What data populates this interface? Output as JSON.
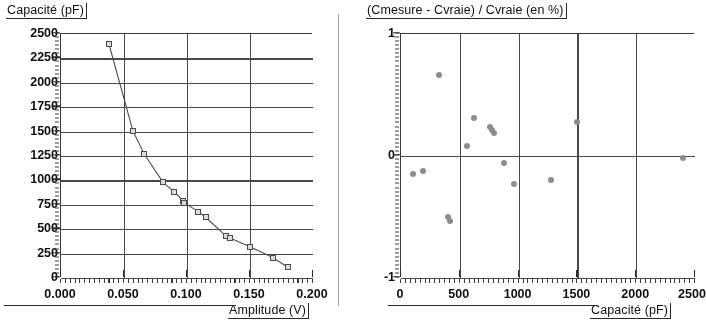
{
  "figure_left": {
    "y_axis_title": "Capacité (pF)",
    "x_axis_title": "Amplitude (V)",
    "y_ticks": [
      "2500",
      "2250",
      "2000",
      "1750",
      "1500",
      "1250",
      "1000",
      "750",
      "500",
      "250",
      "0"
    ],
    "x_ticks": [
      "0.000",
      "0.050",
      "0.100",
      "0.150",
      "0.200"
    ]
  },
  "figure_right": {
    "y_axis_title": "(Cmesure - Cvraie) / Cvraie (en %)",
    "x_axis_title": "Capacité (pF)",
    "y_ticks": [
      "1",
      "0",
      "-1"
    ],
    "x_ticks": [
      "0",
      "500",
      "1000",
      "1500",
      "2000",
      "2500"
    ]
  },
  "colors": {
    "axis": "#3a3a3a",
    "gridline": "#4a4a4a",
    "marker_fill": "#d9d9d9",
    "marker_edge": "#4c4c4c",
    "scatter_point": "#8c8c8c",
    "text": "#111111",
    "background": "#ffffff"
  },
  "chart_data": [
    {
      "type": "line",
      "title": "",
      "xlabel": "Amplitude (V)",
      "ylabel": "Capacité (pF)",
      "xlim": [
        0.0,
        0.2
      ],
      "ylim": [
        0,
        2500
      ],
      "xticks": [
        0.0,
        0.05,
        0.1,
        0.15,
        0.2
      ],
      "yticks": [
        0,
        250,
        500,
        750,
        1000,
        1250,
        1500,
        1750,
        2000,
        2250,
        2500
      ],
      "grid": true,
      "legend": "none",
      "marker": "square",
      "series": [
        {
          "name": "Capacité mesurée",
          "x": [
            0.038,
            0.057,
            0.066,
            0.081,
            0.09,
            0.097,
            0.098,
            0.109,
            0.115,
            0.131,
            0.134,
            0.15,
            0.168,
            0.18
          ],
          "y": [
            2400,
            1510,
            1270,
            980,
            880,
            790,
            770,
            680,
            620,
            430,
            410,
            320,
            210,
            110
          ]
        }
      ]
    },
    {
      "type": "scatter",
      "title": "",
      "xlabel": "Capacité (pF)",
      "ylabel": "(Cmesure - Cvraie) / Cvraie (en %)",
      "xlim": [
        0,
        2500
      ],
      "ylim": [
        -1,
        1
      ],
      "xticks": [
        0,
        500,
        1000,
        1500,
        2000,
        2500
      ],
      "yticks": [
        -1,
        0,
        1
      ],
      "grid": true,
      "legend": "none",
      "marker": "circle",
      "series": [
        {
          "name": "Erreur relative",
          "x": [
            100,
            190,
            320,
            400,
            415,
            560,
            620,
            755,
            775,
            790,
            880,
            965,
            1275,
            1500,
            2400
          ],
          "y": [
            -0.15,
            -0.12,
            0.66,
            -0.5,
            -0.53,
            0.08,
            0.31,
            0.24,
            0.21,
            0.19,
            -0.06,
            -0.23,
            -0.2,
            0.28,
            -0.02
          ]
        }
      ]
    }
  ]
}
